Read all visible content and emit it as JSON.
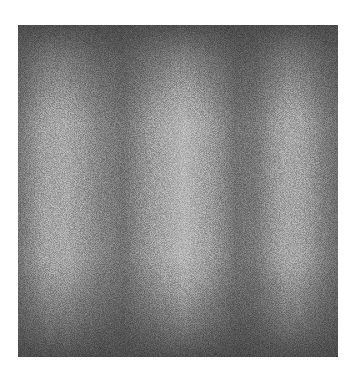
{
  "image": {
    "description": "Grayscale noisy texture with soft vertical light and dark bands, darker at top and bottom edges",
    "band_pattern": [
      "dark",
      "light",
      "dark",
      "light",
      "dark",
      "light",
      "dark"
    ],
    "colors": {
      "background": "#ffffff",
      "dark_band": "#5e5e5e",
      "light_band": "#a2a2a2"
    }
  }
}
